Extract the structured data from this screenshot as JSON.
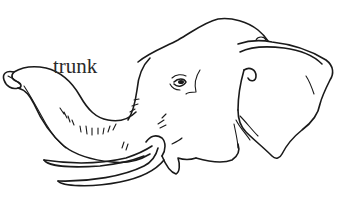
{
  "figure": {
    "labels": [
      {
        "text": "trunk",
        "points_to": "trunk"
      }
    ],
    "colors": {
      "line": "#1a1a1a",
      "background": "#ffffff",
      "label": "#2a2a2a"
    }
  }
}
